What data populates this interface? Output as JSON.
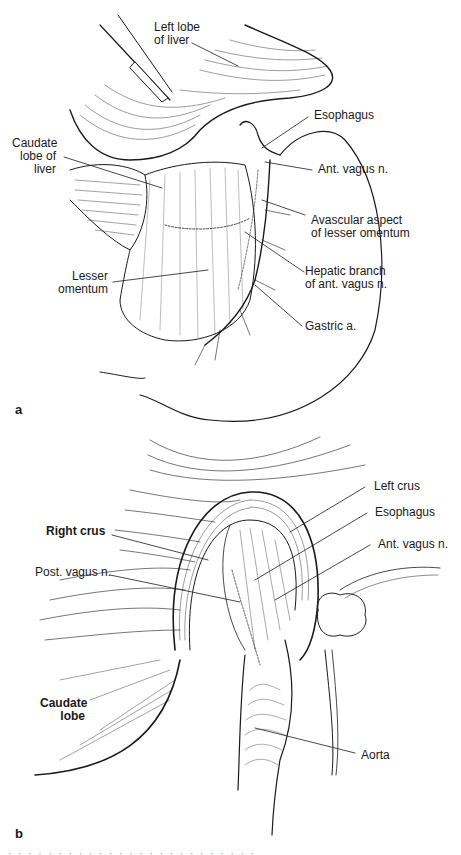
{
  "figure": {
    "panel_a": {
      "letter": "a",
      "labels": {
        "left_lobe": "Left lobe\nof liver",
        "esophagus": "Esophagus",
        "caudate": "Caudate\nlobe of\nliver",
        "ant_vagus": "Ant. vagus n.",
        "avascular": "Avascular aspect\nof lesser omentum",
        "lesser_omentum": "Lesser\nomentum",
        "hepatic_branch": "Hepatic branch\nof ant. vagus n.",
        "gastric": "Gastric a."
      }
    },
    "panel_b": {
      "letter": "b",
      "labels": {
        "left_crus": "Left crus",
        "esophagus": "Esophagus",
        "right_crus": "Right crus",
        "ant_vagus": "Ant. vagus n.",
        "post_vagus": "Post. vagus n.",
        "caudate": "Caudate\nlobe",
        "aorta": "Aorta"
      }
    },
    "caption_partial": "· · · · · · · · · · · · · · · · · · · · · · · · ·"
  }
}
